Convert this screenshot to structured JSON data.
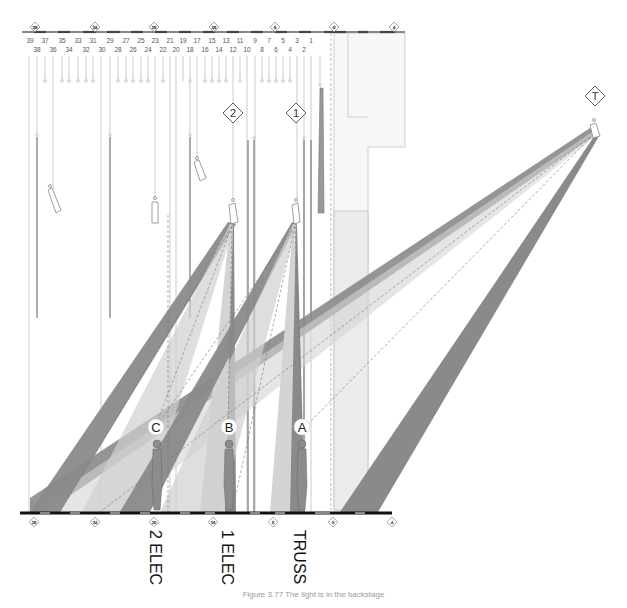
{
  "figure": {
    "caption": "Figure 3.77 The light is in the backstage"
  },
  "lineset_numbers": {
    "top_row": [
      "39",
      "37",
      "35",
      "33",
      "31",
      "29",
      "27",
      "25",
      "23",
      "21",
      "19",
      "17",
      "15",
      "13",
      "11",
      "9",
      "7",
      "5",
      "3",
      "1"
    ],
    "bottom_row": [
      "38",
      "36",
      "34",
      "32",
      "30",
      "28",
      "26",
      "24",
      "22",
      "20",
      "18",
      "16",
      "14",
      "12",
      "10",
      "8",
      "6",
      "4",
      "2"
    ]
  },
  "rail_markers": {
    "top": [
      "28",
      "24",
      "20",
      "16",
      "5",
      "0",
      "4"
    ],
    "bottom": [
      "28",
      "24",
      "20",
      "16",
      "5",
      "0",
      "4"
    ]
  },
  "instrument_markers": [
    {
      "id": "marker-2",
      "label": "2"
    },
    {
      "id": "marker-1",
      "label": "1"
    },
    {
      "id": "marker-T",
      "label": "T"
    }
  ],
  "actor_positions": [
    {
      "id": "position-C",
      "label": "C"
    },
    {
      "id": "position-B",
      "label": "B"
    },
    {
      "id": "position-A",
      "label": "A"
    }
  ],
  "pipe_labels": {
    "second_electric": "2 ELEC",
    "first_electric": "1 ELEC",
    "truss": "TRUSS"
  },
  "colors": {
    "beam_dark": "#8a8a8a",
    "beam_light": "#cfcfcf",
    "actor": "#8c8c8c",
    "lines": "#999999"
  }
}
